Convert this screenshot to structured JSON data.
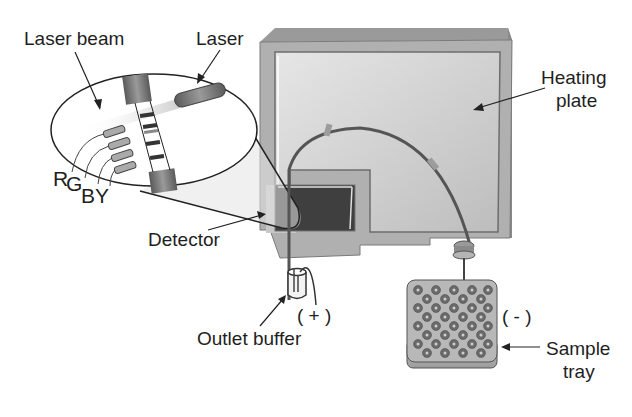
{
  "diagram": {
    "labels": {
      "laser_beam": "Laser beam",
      "laser": "Laser",
      "heating_plate_line1": "Heating",
      "heating_plate_line2": "plate",
      "detector": "Detector",
      "outlet_buffer": "Outlet buffer",
      "positive": "( + )",
      "negative": "( - )",
      "sample_tray_line1": "Sample",
      "sample_tray_line2": "tray",
      "dye_r": "R",
      "dye_g": "G",
      "dye_b": "B",
      "dye_y": "Y"
    },
    "colors": {
      "plate_frame": "#a9a9a9",
      "plate_face": "#c8c8c8",
      "detector_window": "#3f3f3f",
      "capillary": "#555555",
      "tray": "#b5b5b5",
      "well": "#6a6a6a",
      "text": "#1e1e1e"
    }
  }
}
